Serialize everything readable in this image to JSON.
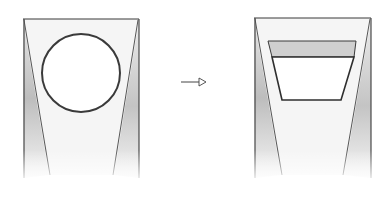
{
  "diagram": {
    "description": "Sketch showing a transformation: a tapered frame with a circular window becomes a tapered frame with a trapezoidal window.",
    "colors": {
      "stroke": "#3a3a3a",
      "shade": "#b8b8b8",
      "hatch": "#d9d9d9",
      "background": "#ffffff"
    },
    "panels": [
      {
        "id": "before",
        "label": "Frame with circular opening",
        "frame": {
          "left": 23,
          "right": 139,
          "top": 19,
          "bottom": 180
        },
        "opening": {
          "shape": "circle",
          "cx": 81,
          "cy": 73,
          "r": 39
        }
      },
      {
        "id": "after",
        "label": "Frame with trapezoidal opening",
        "frame": {
          "left": 254,
          "right": 371,
          "top": 18,
          "bottom": 180
        },
        "opening": {
          "shape": "trapezoid",
          "band_top": 41,
          "band_bottom": 57,
          "bottom": 100
        }
      }
    ],
    "arrow": {
      "from_x": 181,
      "to_x": 207,
      "y": 82,
      "direction": "right"
    }
  }
}
